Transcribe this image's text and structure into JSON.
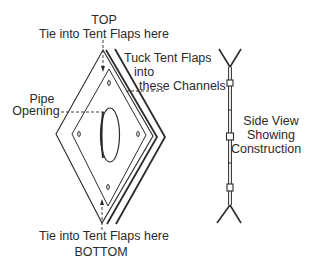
{
  "diagram": {
    "front_view": {
      "labels": {
        "top": "TOP",
        "top_tie": "Tie into Tent Flaps here",
        "tuck_line1": "Tuck Tent Flaps",
        "tuck_line2": "into",
        "tuck_line3": "these Channels",
        "pipe_line1": "Pipe",
        "pipe_line2": "Opening",
        "bottom_tie": "Tie into Tent Flaps here",
        "bottom": "BOTTOM"
      },
      "tie_holes": 4,
      "layers": 3
    },
    "side_view": {
      "label_line1": "Side View",
      "label_line2": "Showing",
      "label_line3": "Construction",
      "brackets": 3
    },
    "colors": {
      "line": "#2b2b2b",
      "text": "#2a2a2a",
      "background": "#ffffff"
    }
  }
}
